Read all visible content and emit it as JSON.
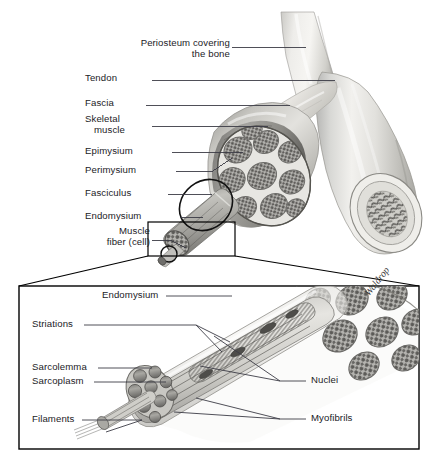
{
  "figure": {
    "artist_signature": "Waldrop",
    "background_color": "#ffffff",
    "label_color": "#1b1b1f",
    "leader_line_color": "#3c3c46",
    "panel_border_color": "#000000",
    "width": 444,
    "height": 474
  },
  "upper_panel": {
    "name": "whole-muscle-and-bone-view",
    "labels": [
      {
        "id": "periosteum",
        "text_line1": "Periosteum covering",
        "text_line2": "the bone",
        "x": 220,
        "y": 41,
        "leader_to_x": 306,
        "leader_y": 47
      },
      {
        "id": "tendon",
        "text": "Tendon",
        "x": 146,
        "y": 76,
        "leader_from_x": 152,
        "leader_to_x": 335,
        "leader_y": 80
      },
      {
        "id": "fascia",
        "text": "Fascia",
        "x": 140,
        "y": 101,
        "leader_from_x": 146,
        "leader_to_x": 290,
        "leader_y": 105
      },
      {
        "id": "skeletal-muscle",
        "text_line1": "Skeletal",
        "text_line2": "muscle",
        "x": 148,
        "y": 116,
        "leader_from_x": 152,
        "leader_to_x": 268,
        "leader_y": 126
      },
      {
        "id": "epimysium",
        "text": "Epimysium",
        "x": 167,
        "y": 148,
        "leader_from_x": 172,
        "leader_to_x": 243,
        "leader_y": 152
      },
      {
        "id": "perimysium",
        "text": "Perimysium",
        "x": 172,
        "y": 167,
        "leader_from_x": 176,
        "leader_to_x": 230,
        "leader_y": 171
      },
      {
        "id": "fasciculus",
        "text": "Fasciculus",
        "x": 163,
        "y": 190,
        "leader_from_x": 168,
        "leader_to_x": 212,
        "leader_y": 194
      },
      {
        "id": "endomysium",
        "text": "Endomysium",
        "x": 176,
        "y": 213,
        "leader_from_x": 180,
        "leader_to_x": 203,
        "leader_y": 217
      },
      {
        "id": "muscle-fiber",
        "text_line1": "Muscle",
        "text_line2": "fiber (cell)",
        "x": 148,
        "y": 228,
        "leader_from_x": 152,
        "leader_to_x": 186,
        "leader_y": 240
      }
    ]
  },
  "lower_panel": {
    "name": "magnified-muscle-fiber-view",
    "box": {
      "x": 18,
      "y": 285,
      "width": 402,
      "height": 165
    },
    "callout_source_box": {
      "x": 148,
      "y": 222,
      "width": 87,
      "height": 34
    },
    "labels_left": [
      {
        "id": "endomysium-2",
        "text": "Endomysium",
        "x": 102,
        "y": 292,
        "leader_from_x": 166,
        "leader_to_x": 232,
        "leader_y": 296
      },
      {
        "id": "striations",
        "text": "Striations",
        "x": 32,
        "y": 321,
        "leader_from_x": 84,
        "leader_to_x": 196,
        "leader_y": 325
      },
      {
        "id": "sarcolemma",
        "text": "Sarcolemma",
        "x": 32,
        "y": 364,
        "leader_from_x": 98,
        "leader_to_x": 152,
        "leader_y": 368
      },
      {
        "id": "sarcoplasm",
        "text": "Sarcoplasm",
        "x": 32,
        "y": 378,
        "leader_from_x": 94,
        "leader_to_x": 160,
        "leader_y": 382
      },
      {
        "id": "filaments",
        "text": "Filaments",
        "x": 32,
        "y": 416,
        "leader_from_x": 82,
        "leader_to_x": 140,
        "leader_y": 420
      }
    ],
    "labels_right": [
      {
        "id": "nuclei",
        "text": "Nuclei",
        "x": 310,
        "y": 377,
        "leader_from_x": 306,
        "leader_to_x": 280,
        "leader_y": 381
      },
      {
        "id": "myofibrils",
        "text": "Myofibrils",
        "x": 310,
        "y": 415,
        "leader_from_x": 306,
        "leader_to_x": 280,
        "leader_y": 419
      }
    ]
  },
  "structures": [
    {
      "id": "bone-shaft",
      "label": "long bone with periosteum"
    },
    {
      "id": "muscle-belly",
      "label": "skeletal muscle belly, cut transversely"
    },
    {
      "id": "muscle-cross-section",
      "label": "cross-section showing fascicles"
    },
    {
      "id": "bone-cross-section",
      "label": "cut end of bone showing marrow"
    },
    {
      "id": "fasciculus-extension",
      "label": "single fasciculus pulled out"
    },
    {
      "id": "muscle-fiber-extension",
      "label": "single muscle fiber pulled out"
    },
    {
      "id": "myofibril-bundle",
      "label": "myofibrils within fiber"
    },
    {
      "id": "filament-bundle",
      "label": "filaments within myofibril"
    }
  ]
}
